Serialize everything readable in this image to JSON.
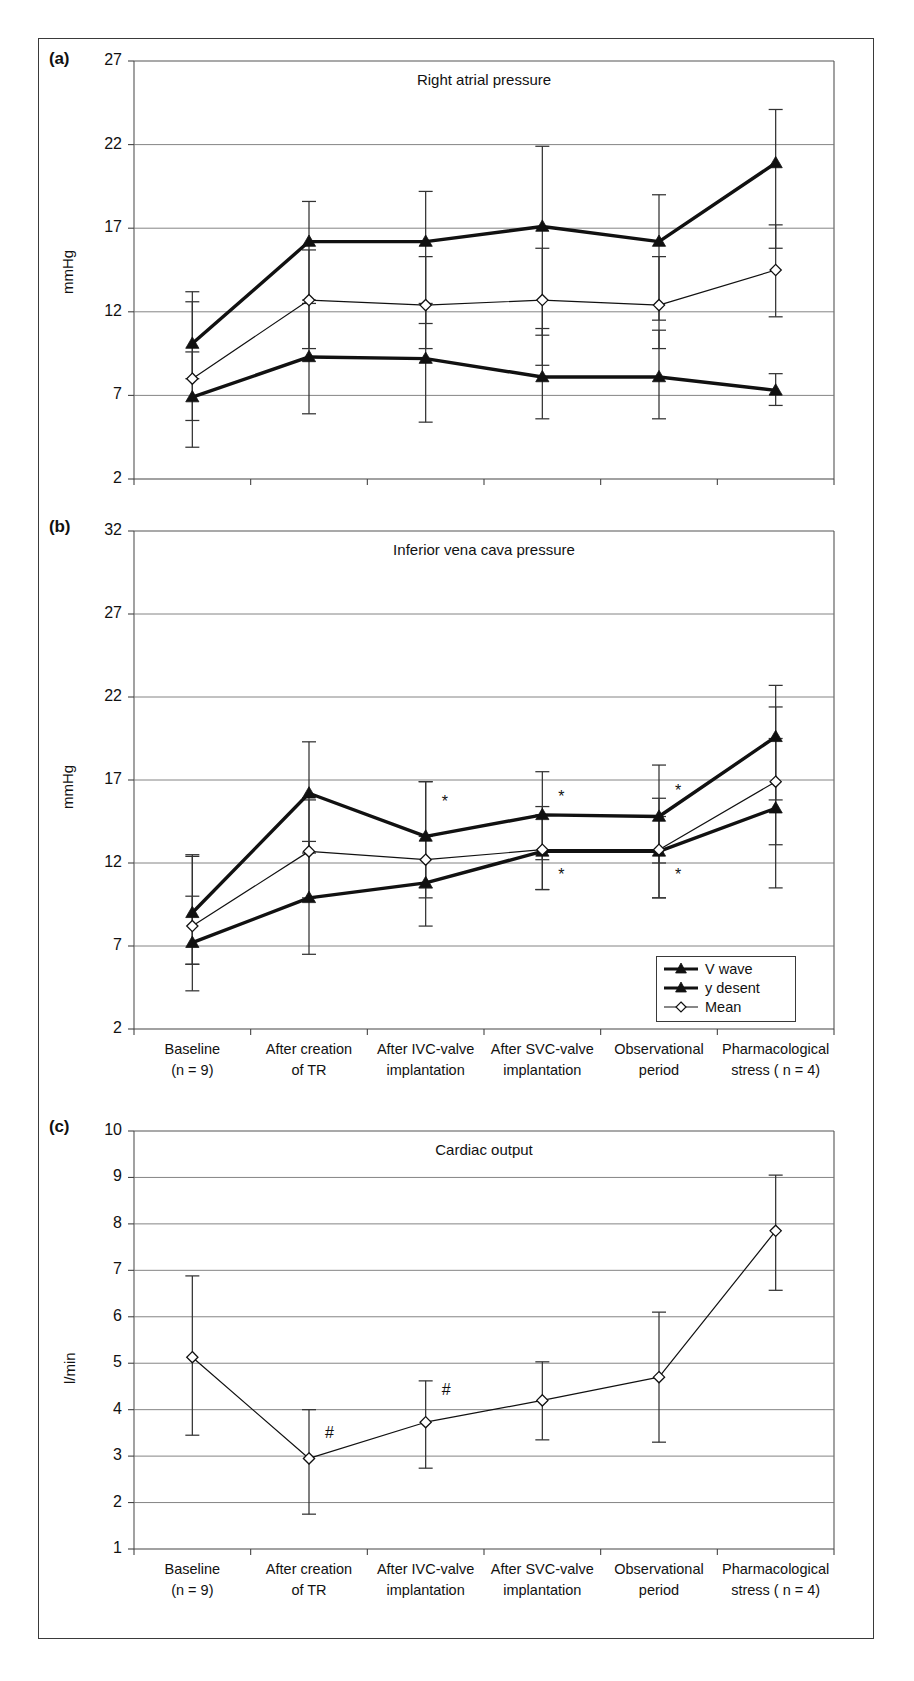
{
  "figure": {
    "panels": [
      {
        "tag": "(a)",
        "title": "Right atrial pressure",
        "ylabel": "mmHg",
        "yticks": [
          27,
          22,
          17,
          12,
          7,
          2
        ],
        "show_xlabels": false
      },
      {
        "tag": "(b)",
        "title": "Inferior vena cava pressure",
        "ylabel": "mmHg",
        "yticks": [
          32,
          27,
          22,
          17,
          12,
          7,
          2
        ],
        "show_xlabels": true
      },
      {
        "tag": "(c)",
        "title": "Cardiac output",
        "ylabel": "l/min",
        "yticks": [
          10,
          9,
          8,
          7,
          6,
          5,
          4,
          3,
          2,
          1
        ],
        "show_xlabels": true
      }
    ],
    "legend": {
      "items": [
        {
          "label": "V wave",
          "marker": "filled-triangle",
          "line": "thick"
        },
        {
          "label": "y desent",
          "marker": "filled-triangle",
          "line": "thick"
        },
        {
          "label": "Mean",
          "marker": "open-diamond",
          "line": "thin"
        }
      ]
    },
    "categories": [
      {
        "line1": "Baseline",
        "line2": "(n = 9)"
      },
      {
        "line1": "After creation",
        "line2": "of TR"
      },
      {
        "line1": "After IVC-valve",
        "line2": "implantation"
      },
      {
        "line1": "After SVC-valve",
        "line2": "implantation"
      },
      {
        "line1": "Observational",
        "line2": "period"
      },
      {
        "line1": "Pharmacological",
        "line2": "stress ( n = 4)"
      }
    ]
  },
  "chart_data": [
    {
      "panel": "a",
      "type": "line",
      "title": "Right atrial pressure",
      "xlabel": "",
      "ylabel": "mmHg",
      "ylim": [
        2,
        27
      ],
      "grid": true,
      "legend_position": "none",
      "categories": [
        "Baseline (n = 9)",
        "After creation of TR",
        "After IVC-valve implantation",
        "After SVC-valve implantation",
        "Observational period",
        "Pharmacological stress ( n = 4)"
      ],
      "series": [
        {
          "name": "V wave",
          "marker": "filled-triangle",
          "values": [
            10.1,
            16.2,
            16.2,
            17.1,
            16.2,
            20.9
          ],
          "err_low": [
            8.0,
            12.7,
            11.3,
            10.6,
            11.5,
            15.8
          ],
          "err_high": [
            12.6,
            18.6,
            19.2,
            21.9,
            19.0,
            24.1
          ]
        },
        {
          "name": "y desent",
          "marker": "filled-triangle",
          "values": [
            6.9,
            9.3,
            9.2,
            8.1,
            8.1,
            7.3
          ],
          "err_low": [
            3.9,
            5.9,
            5.4,
            5.6,
            5.6,
            6.4
          ],
          "err_high": [
            9.6,
            12.5,
            12.5,
            11.0,
            10.9,
            8.3
          ]
        },
        {
          "name": "Mean",
          "marker": "open-diamond",
          "values": [
            8.0,
            12.7,
            12.4,
            12.7,
            12.4,
            14.5
          ],
          "err_low": [
            5.5,
            9.8,
            9.8,
            8.8,
            9.8,
            11.7
          ],
          "err_high": [
            13.2,
            15.7,
            15.3,
            15.8,
            15.3,
            17.2
          ]
        }
      ]
    },
    {
      "panel": "b",
      "type": "line",
      "title": "Inferior vena cava pressure",
      "xlabel": "",
      "ylabel": "mmHg",
      "ylim": [
        2,
        32
      ],
      "grid": true,
      "legend_position": "bottom-right",
      "categories": [
        "Baseline (n = 9)",
        "After creation of TR",
        "After IVC-valve implantation",
        "After SVC-valve implantation",
        "Observational period",
        "Pharmacological stress ( n = 4)"
      ],
      "series": [
        {
          "name": "V wave",
          "marker": "filled-triangle",
          "values": [
            9.0,
            16.2,
            13.6,
            14.9,
            14.8,
            19.6
          ],
          "err_low": [
            5.9,
            12.6,
            10.5,
            12.2,
            12.0,
            15.8
          ],
          "err_high": [
            12.4,
            19.3,
            16.9,
            17.5,
            17.9,
            22.7
          ]
        },
        {
          "name": "y desent",
          "marker": "filled-triangle",
          "values": [
            7.2,
            9.9,
            10.8,
            12.7,
            12.7,
            15.3
          ],
          "err_low": [
            4.3,
            6.5,
            8.2,
            10.4,
            9.9,
            10.5
          ],
          "err_high": [
            10.0,
            13.3,
            13.6,
            14.9,
            14.8,
            19.5
          ]
        },
        {
          "name": "Mean",
          "marker": "open-diamond",
          "values": [
            8.2,
            12.7,
            12.2,
            12.8,
            12.8,
            16.9
          ],
          "err_low": [
            5.9,
            9.9,
            9.9,
            10.4,
            9.9,
            13.1
          ],
          "err_high": [
            12.5,
            15.8,
            16.9,
            15.4,
            15.9,
            21.4
          ]
        }
      ],
      "annotations": [
        {
          "text": "*",
          "category_index": 2,
          "y": 15.6
        },
        {
          "text": "*",
          "category_index": 3,
          "y": 15.9
        },
        {
          "text": "*",
          "category_index": 4,
          "y": 16.3
        },
        {
          "text": "*",
          "category_index": 3,
          "y": 11.2
        },
        {
          "text": "*",
          "category_index": 4,
          "y": 11.2
        }
      ]
    },
    {
      "panel": "c",
      "type": "line",
      "title": "Cardiac output",
      "xlabel": "",
      "ylabel": "l/min",
      "ylim": [
        1,
        10
      ],
      "grid": true,
      "legend_position": "none",
      "categories": [
        "Baseline (n = 9)",
        "After creation of TR",
        "After IVC-valve implantation",
        "After SVC-valve implantation",
        "Observational period",
        "Pharmacological stress ( n = 4)"
      ],
      "series": [
        {
          "name": "Cardiac output",
          "marker": "open-diamond",
          "values": [
            5.13,
            2.95,
            3.73,
            4.2,
            4.7,
            7.85
          ],
          "err_low": [
            3.45,
            1.75,
            2.74,
            3.35,
            3.3,
            6.57
          ],
          "err_high": [
            6.88,
            4.0,
            4.62,
            5.03,
            6.1,
            9.05
          ]
        }
      ],
      "annotations": [
        {
          "text": "#",
          "category_index": 1,
          "y": 3.48
        },
        {
          "text": "#",
          "category_index": 2,
          "y": 4.4
        }
      ]
    }
  ]
}
